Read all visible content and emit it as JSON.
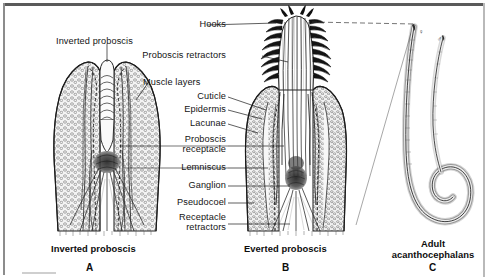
{
  "figure": {
    "type": "scientific-anatomical-diagram",
    "background_color": "#ffffff",
    "ink_color": "#141414"
  },
  "panels": [
    {
      "letter": "A",
      "caption": "Inverted proboscis",
      "description": "Longitudinal section of an acanthocephalan with the proboscis retracted (inverted) into the proboscis receptacle."
    },
    {
      "letter": "B",
      "caption": "Everted proboscis",
      "description": "Longitudinal section of an acanthocephalan with the proboscis everted, showing rows of recurved hooks."
    },
    {
      "letter": "C",
      "caption_line1": "Adult",
      "caption_line2": "acanthocephalans",
      "description": "Whole adult worms, a larger female and a smaller male.",
      "female_symbol": "♀",
      "male_symbol": "♂"
    }
  ],
  "labels_left": [
    {
      "text": "Inverted proboscis",
      "target": "proboscis inverted into receptacle"
    },
    {
      "text": "Muscle layers",
      "target": "body wall muscle layers"
    }
  ],
  "labels_center": [
    {
      "text": "Hooks",
      "target": "recurved proboscis hooks"
    },
    {
      "text": "Proboscis retractors",
      "target": "proboscis retractor muscles"
    },
    {
      "text": "Cuticle",
      "target": "outer cuticle layer"
    },
    {
      "text": "Epidermis",
      "target": "epidermal syncytium"
    },
    {
      "text": "Lacunae",
      "target": "lacunar canal system"
    },
    {
      "text": "Proboscis receptacle",
      "target": "proboscis receptacle sheath"
    },
    {
      "text": "Lemniscus",
      "target": "lemniscus"
    },
    {
      "text": "Ganglion",
      "target": "cerebral ganglion"
    },
    {
      "text": "Pseudocoel",
      "target": "pseudocoelomic cavity"
    },
    {
      "text": "Receptacle retractors",
      "target": "receptacle retractor muscles"
    }
  ]
}
